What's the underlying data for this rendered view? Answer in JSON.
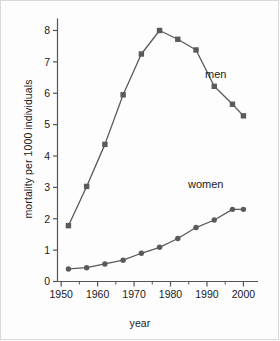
{
  "figure": {
    "background_color": "#fdfdfd",
    "border_color": "#d8d8d8",
    "line_color": "#5a5a5a",
    "axis_color": "#555555",
    "text_color": "#1a1a1a"
  },
  "chart_data": {
    "type": "line",
    "title": "",
    "xlabel": "year",
    "ylabel": "mortality per 1000 individuals",
    "xlim": [
      1949,
      2004
    ],
    "ylim": [
      0,
      8.35
    ],
    "xticks": [
      1950,
      1960,
      1970,
      1980,
      1990,
      2000
    ],
    "xtick_labels": [
      "1950",
      "1960",
      "1970",
      "1980",
      "1990",
      "2000"
    ],
    "xminor_ticks": [
      1955,
      1965,
      1975,
      1985,
      1995
    ],
    "yticks": [
      0,
      1,
      2,
      3,
      4,
      5,
      6,
      7,
      8
    ],
    "ytick_labels": [
      "0",
      "1",
      "2",
      "3",
      "4",
      "5",
      "6",
      "7",
      "8"
    ],
    "grid": false,
    "legend_position": "inline-annotation",
    "x": [
      1952,
      1957,
      1962,
      1967,
      1972,
      1977,
      1982,
      1987,
      1992,
      1997,
      2000
    ],
    "series": [
      {
        "name": "men",
        "marker": "square",
        "color": "#5a5a5a",
        "label_x": 1995,
        "label_y": 6.45,
        "values": [
          1.78,
          3.03,
          4.37,
          5.95,
          7.25,
          8.0,
          7.72,
          7.38,
          6.22,
          5.65,
          5.28
        ]
      },
      {
        "name": "women",
        "marker": "circle",
        "color": "#5a5a5a",
        "label_x": 1992,
        "label_y": 3.1,
        "values": [
          0.4,
          0.44,
          0.56,
          0.68,
          0.9,
          1.09,
          1.37,
          1.72,
          1.96,
          2.3,
          2.3
        ]
      }
    ]
  }
}
